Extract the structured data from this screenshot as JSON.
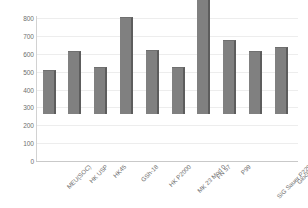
{
  "chart_data": {
    "type": "bar",
    "title": "",
    "xlabel": "",
    "ylabel": "",
    "ylim": [
      0,
      800
    ],
    "ytick_step": 100,
    "grid": true,
    "legend": "none",
    "bar_color": "#808080",
    "bar_edge_color": "#5d5d5d",
    "gridline_color": "#ededed",
    "axis_color": "#c9c9c9",
    "tick_label_color": "#6e6e6e",
    "categories": [
      "MEU(SOC)",
      "HK USP",
      "HK45",
      "GSh-18",
      "HK P2000",
      "MK 23 Mod 0",
      "FN 57",
      "P99",
      "SIG Sauer P229",
      "Glock 18"
    ],
    "values": [
      245,
      355,
      265,
      540,
      360,
      265,
      775,
      415,
      350,
      375
    ],
    "yticks": [
      0,
      100,
      200,
      300,
      400,
      500,
      600,
      700,
      800
    ],
    "ytick_labels": [
      "0",
      "100",
      "200",
      "300",
      "400",
      "500",
      "600",
      "700",
      "800"
    ]
  }
}
